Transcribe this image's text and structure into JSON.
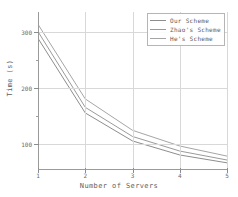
{
  "chart_data": {
    "type": "line",
    "title": "",
    "xlabel": "Number of Servers",
    "ylabel": "Time (s)",
    "x": [
      1,
      2,
      3,
      4,
      5
    ],
    "categories": [
      "1",
      "2",
      "3",
      "4",
      "5"
    ],
    "xtick_labels": [
      "1",
      "2",
      "3",
      "4",
      "5"
    ],
    "ytick_labels": [
      "100",
      "200",
      "300"
    ],
    "yticks": [
      100,
      200,
      300
    ],
    "xlim": [
      1,
      5
    ],
    "ylim": [
      55,
      335
    ],
    "grid": true,
    "legend_position": "upper-right",
    "series": [
      {
        "name": "Our Scheme",
        "color": "#8d8d8d",
        "values": [
          288,
          155,
          105,
          80,
          66
        ]
      },
      {
        "name": "Zhao's Scheme",
        "color": "#9a9a9a",
        "values": [
          300,
          165,
          113,
          87,
          71
        ]
      },
      {
        "name": "He's Scheme",
        "color": "#a5a5a5",
        "values": [
          313,
          180,
          124,
          96,
          78
        ]
      }
    ]
  },
  "legend": {
    "entries": [
      {
        "label": "Our Scheme"
      },
      {
        "label": "Zhao's Scheme"
      },
      {
        "label": "He's Scheme"
      }
    ]
  },
  "axes": {
    "x_title": "Number of Servers",
    "y_title": "Time (s)"
  },
  "colors": {
    "axis": "#9a9a9a",
    "grid": "#d8d8d8",
    "text": "#5d5d5d",
    "background": "#ffffff"
  }
}
